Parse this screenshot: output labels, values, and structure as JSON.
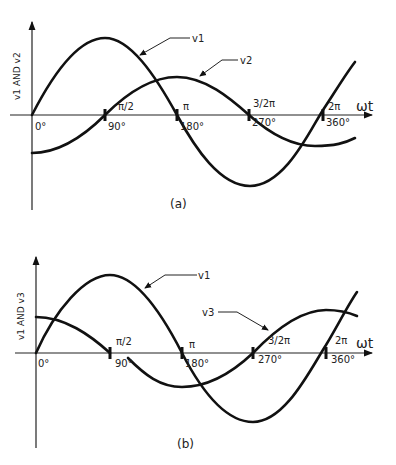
{
  "diagram_a": {
    "caption": "(a)",
    "y_axis_label": "v1 AND v2",
    "x_axis_label": "ωt",
    "curve_labels": {
      "v1": "v1",
      "v2": "v2"
    },
    "radian_ticks": [
      "π/2",
      "π",
      "3/2π",
      "2π"
    ],
    "degree_ticks": [
      "0°",
      "90°",
      "180°",
      "270°",
      "360°"
    ]
  },
  "diagram_b": {
    "caption": "(b)",
    "y_axis_label": "v1 AND v3",
    "x_axis_label": "ωt",
    "curve_labels": {
      "v1": "v1",
      "v3": "v3"
    },
    "radian_ticks": [
      "π/2",
      "π",
      "3/2π",
      "2π"
    ],
    "degree_ticks": [
      "0°",
      "90°",
      "180°",
      "270°",
      "360°"
    ]
  },
  "colors": {
    "line": "#111111",
    "background": "#ffffff"
  }
}
